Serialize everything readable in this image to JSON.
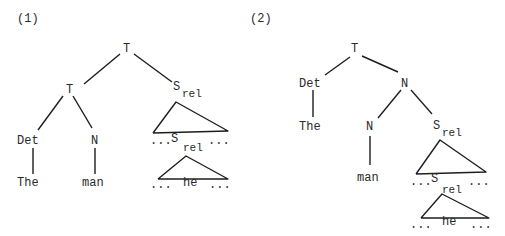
{
  "trees": [
    {
      "label": "(1)",
      "nodes": {
        "root": "T",
        "left": "T",
        "det": "Det",
        "n": "N",
        "srel": "S",
        "srel_sub": "rel",
        "the": "The",
        "man": "man",
        "embedded_left_dots": "...",
        "embedded_s": "S",
        "embedded_s_sub": "rel",
        "embedded_right_dots": "...",
        "bottom_left_dots": "...",
        "he": "he",
        "bottom_right_dots": "..."
      }
    },
    {
      "label": "(2)",
      "nodes": {
        "root": "T",
        "det": "Det",
        "n": "N",
        "the": "The",
        "n_child": "N",
        "srel": "S",
        "srel_sub": "rel",
        "man": "man",
        "embedded_left_dots": "...",
        "embedded_s": "S",
        "embedded_s_sub": "rel",
        "embedded_right_dots": "...",
        "bottom_left_dots": "...",
        "he": "he",
        "bottom_right_dots": "..."
      }
    }
  ],
  "colors": {
    "ink": "#1e1e1e",
    "background": "#ffffff"
  }
}
